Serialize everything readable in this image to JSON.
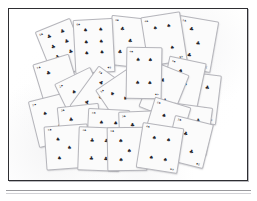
{
  "figure": {
    "background_color": "#ffffff",
    "frame_color": "#2e2e32",
    "card_face_color": "#fbfbfb",
    "card_edge_color": "#b5b5bb",
    "pip_color": "#232329",
    "rule_color": "#9a9a9e",
    "card_count": 24
  },
  "frame": {
    "x": 8,
    "y": 8,
    "width": 240,
    "height": 173,
    "border_width": 1
  },
  "rule": {
    "y": 190,
    "x": 6,
    "width": 245
  },
  "suits": {
    "spade": "♠",
    "club": "♣",
    "heart": "♥",
    "diamond": "♦"
  },
  "cards": [
    {
      "id": "card-01",
      "label": "six-of-clubs",
      "x": 42,
      "y": 22,
      "w": 38,
      "h": 52,
      "rot": -22,
      "suit": "club",
      "rank": "6",
      "z": 2,
      "pips": [
        [
          30,
          18
        ],
        [
          70,
          18
        ],
        [
          30,
          40
        ],
        [
          70,
          40
        ],
        [
          30,
          62
        ],
        [
          70,
          62
        ]
      ]
    },
    {
      "id": "card-02",
      "label": "six-of-spades",
      "x": 73,
      "y": 18,
      "w": 40,
      "h": 54,
      "rot": -3,
      "suit": "spade",
      "rank": "6",
      "z": 6,
      "pips": [
        [
          30,
          20
        ],
        [
          70,
          20
        ],
        [
          30,
          42
        ],
        [
          70,
          42
        ],
        [
          30,
          64
        ],
        [
          70,
          64
        ]
      ]
    },
    {
      "id": "card-03",
      "label": "three-of-clubs",
      "x": 108,
      "y": 16,
      "w": 42,
      "h": 50,
      "rot": 6,
      "suit": "club",
      "rank": "3",
      "z": 3,
      "pips": [
        [
          28,
          24
        ],
        [
          50,
          48
        ],
        [
          28,
          72
        ]
      ]
    },
    {
      "id": "card-04",
      "label": "four-of-spades",
      "x": 143,
      "y": 13,
      "w": 40,
      "h": 50,
      "rot": -9,
      "suit": "spade",
      "rank": "4",
      "z": 4,
      "pips": [
        [
          32,
          26
        ],
        [
          68,
          26
        ],
        [
          32,
          70
        ],
        [
          68,
          70
        ]
      ]
    },
    {
      "id": "card-05",
      "label": "three-of-clubs",
      "x": 174,
      "y": 17,
      "w": 40,
      "h": 52,
      "rot": 10,
      "suit": "club",
      "rank": "3",
      "z": 3,
      "pips": [
        [
          34,
          22
        ],
        [
          58,
          48
        ],
        [
          40,
          74
        ]
      ]
    },
    {
      "id": "card-06",
      "label": "four-of-spades",
      "x": 125,
      "y": 46,
      "w": 36,
      "h": 52,
      "rot": 1,
      "suit": "spade",
      "rank": "4",
      "z": 9,
      "pips": [
        [
          32,
          24
        ],
        [
          68,
          24
        ],
        [
          32,
          70
        ],
        [
          68,
          70
        ]
      ]
    },
    {
      "id": "card-07",
      "label": "two-of-clubs",
      "x": 38,
      "y": 57,
      "w": 38,
      "h": 52,
      "rot": -17,
      "suit": "club",
      "rank": "2",
      "z": 5,
      "pips": [
        [
          34,
          24
        ],
        [
          56,
          70
        ]
      ]
    },
    {
      "id": "card-08",
      "label": "two-of-spades",
      "x": 62,
      "y": 72,
      "w": 40,
      "h": 50,
      "rot": -26,
      "suit": "spade",
      "rank": "2",
      "z": 6,
      "pips": [
        [
          36,
          32
        ],
        [
          60,
          66
        ]
      ]
    },
    {
      "id": "card-09",
      "label": "five-of-clubs",
      "x": 79,
      "y": 72,
      "w": 42,
      "h": 50,
      "rot": 36,
      "suit": "club",
      "rank": "5",
      "z": 7,
      "pips": [
        [
          28,
          26
        ],
        [
          68,
          26
        ],
        [
          48,
          50
        ],
        [
          28,
          74
        ],
        [
          68,
          74
        ]
      ]
    },
    {
      "id": "card-10",
      "label": "three-of-spades",
      "x": 104,
      "y": 74,
      "w": 40,
      "h": 48,
      "rot": -34,
      "suit": "spade",
      "rank": "3",
      "z": 8,
      "pips": [
        [
          30,
          26
        ],
        [
          52,
          50
        ],
        [
          30,
          76
        ]
      ]
    },
    {
      "id": "card-11",
      "label": "two-of-clubs",
      "x": 145,
      "y": 66,
      "w": 36,
      "h": 48,
      "rot": 22,
      "suit": "club",
      "rank": "2",
      "z": 8,
      "pips": [
        [
          34,
          30
        ],
        [
          62,
          70
        ]
      ]
    },
    {
      "id": "card-12",
      "label": "three-of-spades",
      "x": 163,
      "y": 58,
      "w": 38,
      "h": 50,
      "rot": 12,
      "suit": "spade",
      "rank": "3",
      "z": 7,
      "pips": [
        [
          36,
          26
        ],
        [
          56,
          50
        ],
        [
          36,
          74
        ]
      ]
    },
    {
      "id": "card-13",
      "label": "four-of-clubs",
      "x": 178,
      "y": 72,
      "w": 40,
      "h": 50,
      "rot": 7,
      "suit": "club",
      "rank": "4",
      "z": 6,
      "pips": [
        [
          32,
          28
        ],
        [
          68,
          28
        ],
        [
          32,
          72
        ],
        [
          68,
          72
        ]
      ]
    },
    {
      "id": "card-14",
      "label": "two-of-spades",
      "x": 32,
      "y": 95,
      "w": 40,
      "h": 48,
      "rot": -14,
      "suit": "spade",
      "rank": "2",
      "z": 5,
      "pips": [
        [
          34,
          32
        ],
        [
          62,
          68
        ]
      ]
    },
    {
      "id": "card-15",
      "label": "three-of-clubs",
      "x": 58,
      "y": 104,
      "w": 42,
      "h": 46,
      "rot": -6,
      "suit": "club",
      "rank": "3",
      "z": 7,
      "pips": [
        [
          30,
          30
        ],
        [
          52,
          52
        ],
        [
          30,
          76
        ]
      ]
    },
    {
      "id": "card-16",
      "label": "four-of-spades",
      "x": 86,
      "y": 108,
      "w": 42,
      "h": 48,
      "rot": 3,
      "suit": "spade",
      "rank": "4",
      "z": 8,
      "pips": [
        [
          32,
          28
        ],
        [
          68,
          28
        ],
        [
          32,
          72
        ],
        [
          68,
          72
        ]
      ]
    },
    {
      "id": "card-17",
      "label": "three-of-clubs",
      "x": 118,
      "y": 110,
      "w": 40,
      "h": 48,
      "rot": -2,
      "suit": "club",
      "rank": "3",
      "z": 9,
      "pips": [
        [
          34,
          28
        ],
        [
          54,
          52
        ],
        [
          34,
          76
        ]
      ]
    },
    {
      "id": "card-18",
      "label": "two-of-spades",
      "x": 146,
      "y": 100,
      "w": 38,
      "h": 50,
      "rot": 17,
      "suit": "spade",
      "rank": "2",
      "z": 10,
      "pips": [
        [
          36,
          32
        ],
        [
          62,
          68
        ]
      ]
    },
    {
      "id": "card-19",
      "label": "four-of-clubs",
      "x": 169,
      "y": 104,
      "w": 40,
      "h": 48,
      "rot": 8,
      "suit": "club",
      "rank": "4",
      "z": 9,
      "pips": [
        [
          32,
          30
        ],
        [
          68,
          30
        ],
        [
          32,
          72
        ],
        [
          68,
          72
        ]
      ]
    },
    {
      "id": "card-20",
      "label": "three-of-spades",
      "x": 44,
      "y": 124,
      "w": 44,
      "h": 44,
      "rot": -4,
      "suit": "spade",
      "rank": "3",
      "z": 11,
      "pips": [
        [
          30,
          30
        ],
        [
          56,
          52
        ],
        [
          30,
          76
        ]
      ]
    },
    {
      "id": "card-21",
      "label": "four-of-clubs",
      "x": 77,
      "y": 126,
      "w": 42,
      "h": 44,
      "rot": 2,
      "suit": "club",
      "rank": "4",
      "z": 12,
      "pips": [
        [
          32,
          30
        ],
        [
          68,
          30
        ],
        [
          32,
          74
        ],
        [
          68,
          74
        ]
      ]
    },
    {
      "id": "card-22",
      "label": "three-of-spades",
      "x": 106,
      "y": 126,
      "w": 40,
      "h": 44,
      "rot": -1,
      "suit": "spade",
      "rank": "3",
      "z": 12,
      "pips": [
        [
          34,
          30
        ],
        [
          56,
          54
        ],
        [
          34,
          76
        ]
      ]
    },
    {
      "id": "card-23",
      "label": "four-of-spades",
      "x": 138,
      "y": 124,
      "w": 42,
      "h": 46,
      "rot": 9,
      "suit": "spade",
      "rank": "4",
      "z": 13,
      "pips": [
        [
          32,
          30
        ],
        [
          68,
          30
        ],
        [
          32,
          74
        ],
        [
          68,
          74
        ]
      ]
    },
    {
      "id": "card-24",
      "label": "two-of-clubs",
      "x": 168,
      "y": 118,
      "w": 40,
      "h": 46,
      "rot": 14,
      "suit": "club",
      "rank": "2",
      "z": 11,
      "pips": [
        [
          36,
          34
        ],
        [
          62,
          70
        ]
      ]
    }
  ]
}
